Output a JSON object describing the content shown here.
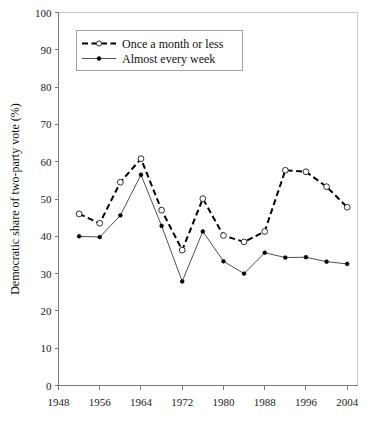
{
  "chart_data": {
    "type": "line",
    "title": "",
    "xlabel": "",
    "ylabel": "Democratic share of two-party vote (%)",
    "xlim": [
      1948,
      2006
    ],
    "ylim": [
      0,
      100
    ],
    "grid": false,
    "legend_position": "upper left",
    "x": [
      1952,
      1956,
      1960,
      1964,
      1968,
      1972,
      1976,
      1980,
      1984,
      1988,
      1992,
      1996,
      2000,
      2004
    ],
    "xticks": [
      "1948",
      "1956",
      "1964",
      "1972",
      "1980",
      "1988",
      "1996",
      "2004"
    ],
    "xtick_values": [
      1948,
      1956,
      1964,
      1972,
      1980,
      1988,
      1996,
      2004
    ],
    "yticks": [
      "0",
      "10",
      "20",
      "30",
      "40",
      "50",
      "60",
      "70",
      "80",
      "90",
      "100"
    ],
    "ytick_values": [
      0,
      10,
      20,
      30,
      40,
      50,
      60,
      70,
      80,
      90,
      100
    ],
    "series": [
      {
        "name": "Once a month or less",
        "marker": "open-circle",
        "linestyle": "dashed",
        "color": "#000000",
        "values": [
          46.0,
          43.5,
          54.5,
          60.8,
          47.0,
          36.3,
          50.1,
          40.2,
          38.5,
          41.3,
          57.7,
          57.3,
          53.3,
          47.8
        ]
      },
      {
        "name": "Almost every week",
        "marker": "filled-circle",
        "linestyle": "solid",
        "color": "#3d3d3d",
        "values": [
          40.0,
          39.8,
          45.6,
          56.5,
          42.8,
          27.9,
          41.3,
          33.3,
          30.0,
          35.6,
          34.3,
          34.4,
          33.2,
          32.6
        ]
      }
    ]
  },
  "legend": {
    "entries": [
      {
        "label": "Once a month or less"
      },
      {
        "label": "Almost every week"
      }
    ]
  },
  "axes": {
    "y_title": "Democratic share of two-party vote (%)"
  }
}
